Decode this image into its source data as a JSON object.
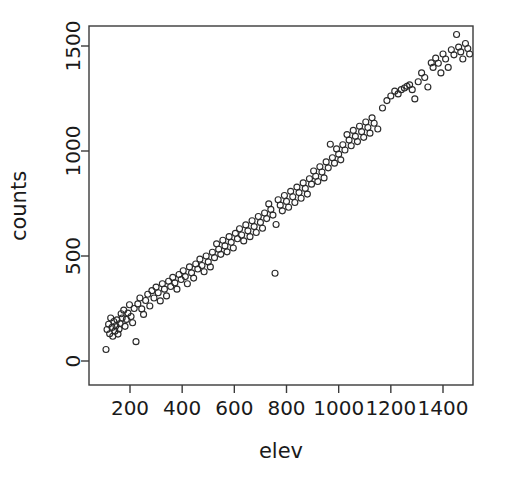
{
  "chart_data": {
    "type": "scatter",
    "title": "",
    "xlabel": "elev",
    "ylabel": "counts",
    "xlim": [
      62,
      1525
    ],
    "ylim": [
      -35,
      1610
    ],
    "xticks": [
      200,
      400,
      600,
      800,
      1000,
      1200,
      1400
    ],
    "yticks": [
      0,
      500,
      1000,
      1500
    ],
    "xtick_labels": [
      "200",
      "400",
      "600",
      "800",
      "1000",
      "1200",
      "1400"
    ],
    "ytick_labels": [
      "0",
      "500",
      "1000",
      "1500"
    ],
    "grid": false,
    "legend": "none",
    "marker": "open-circle",
    "marker_color": "#2b2b2b",
    "marker_size": 6,
    "n_points": 152,
    "points": [
      [
        108,
        55
      ],
      [
        112,
        150
      ],
      [
        118,
        175
      ],
      [
        122,
        130
      ],
      [
        126,
        205
      ],
      [
        131,
        160
      ],
      [
        134,
        118
      ],
      [
        138,
        188
      ],
      [
        142,
        142
      ],
      [
        146,
        168
      ],
      [
        150,
        196
      ],
      [
        154,
        128
      ],
      [
        158,
        152
      ],
      [
        162,
        178
      ],
      [
        166,
        225
      ],
      [
        170,
        205
      ],
      [
        176,
        242
      ],
      [
        181,
        165
      ],
      [
        186,
        198
      ],
      [
        192,
        228
      ],
      [
        198,
        268
      ],
      [
        204,
        212
      ],
      [
        210,
        182
      ],
      [
        216,
        250
      ],
      [
        223,
        92
      ],
      [
        230,
        272
      ],
      [
        238,
        300
      ],
      [
        245,
        248
      ],
      [
        252,
        222
      ],
      [
        260,
        288
      ],
      [
        268,
        318
      ],
      [
        276,
        262
      ],
      [
        284,
        335
      ],
      [
        292,
        300
      ],
      [
        300,
        352
      ],
      [
        308,
        325
      ],
      [
        316,
        286
      ],
      [
        324,
        368
      ],
      [
        332,
        342
      ],
      [
        340,
        310
      ],
      [
        348,
        380
      ],
      [
        356,
        355
      ],
      [
        364,
        398
      ],
      [
        372,
        372
      ],
      [
        380,
        342
      ],
      [
        388,
        412
      ],
      [
        396,
        388
      ],
      [
        404,
        430
      ],
      [
        412,
        402
      ],
      [
        420,
        368
      ],
      [
        428,
        448
      ],
      [
        436,
        420
      ],
      [
        444,
        395
      ],
      [
        452,
        462
      ],
      [
        460,
        438
      ],
      [
        468,
        485
      ],
      [
        476,
        455
      ],
      [
        484,
        425
      ],
      [
        492,
        500
      ],
      [
        500,
        472
      ],
      [
        508,
        448
      ],
      [
        516,
        518
      ],
      [
        524,
        492
      ],
      [
        532,
        558
      ],
      [
        540,
        532
      ],
      [
        548,
        508
      ],
      [
        556,
        575
      ],
      [
        564,
        548
      ],
      [
        572,
        520
      ],
      [
        580,
        592
      ],
      [
        588,
        565
      ],
      [
        596,
        538
      ],
      [
        604,
        608
      ],
      [
        612,
        582
      ],
      [
        620,
        630
      ],
      [
        628,
        600
      ],
      [
        636,
        572
      ],
      [
        644,
        648
      ],
      [
        652,
        620
      ],
      [
        660,
        592
      ],
      [
        668,
        668
      ],
      [
        676,
        640
      ],
      [
        684,
        612
      ],
      [
        692,
        688
      ],
      [
        700,
        660
      ],
      [
        708,
        632
      ],
      [
        716,
        705
      ],
      [
        724,
        678
      ],
      [
        732,
        748
      ],
      [
        740,
        722
      ],
      [
        748,
        695
      ],
      [
        756,
        418
      ],
      [
        760,
        650
      ],
      [
        768,
        768
      ],
      [
        776,
        742
      ],
      [
        784,
        715
      ],
      [
        792,
        788
      ],
      [
        800,
        760
      ],
      [
        808,
        732
      ],
      [
        816,
        808
      ],
      [
        824,
        782
      ],
      [
        832,
        755
      ],
      [
        840,
        828
      ],
      [
        848,
        802
      ],
      [
        856,
        775
      ],
      [
        864,
        848
      ],
      [
        872,
        822
      ],
      [
        880,
        795
      ],
      [
        888,
        868
      ],
      [
        896,
        842
      ],
      [
        904,
        905
      ],
      [
        912,
        880
      ],
      [
        920,
        855
      ],
      [
        928,
        925
      ],
      [
        936,
        900
      ],
      [
        944,
        872
      ],
      [
        952,
        948
      ],
      [
        960,
        920
      ],
      [
        968,
        1032
      ],
      [
        976,
        968
      ],
      [
        984,
        942
      ],
      [
        992,
        1010
      ],
      [
        1000,
        985
      ],
      [
        1008,
        958
      ],
      [
        1016,
        1030
      ],
      [
        1024,
        1005
      ],
      [
        1032,
        1078
      ],
      [
        1040,
        1052
      ],
      [
        1048,
        1025
      ],
      [
        1056,
        1098
      ],
      [
        1064,
        1070
      ],
      [
        1072,
        1045
      ],
      [
        1080,
        1118
      ],
      [
        1088,
        1092
      ],
      [
        1096,
        1065
      ],
      [
        1104,
        1138
      ],
      [
        1112,
        1112
      ],
      [
        1120,
        1085
      ],
      [
        1128,
        1158
      ],
      [
        1136,
        1132
      ],
      [
        1150,
        1105
      ],
      [
        1168,
        1205
      ],
      [
        1185,
        1240
      ],
      [
        1200,
        1262
      ],
      [
        1215,
        1285
      ],
      [
        1228,
        1272
      ],
      [
        1240,
        1292
      ],
      [
        1252,
        1300
      ],
      [
        1262,
        1308
      ],
      [
        1272,
        1315
      ],
      [
        1282,
        1292
      ],
      [
        1292,
        1248
      ],
      [
        1305,
        1330
      ],
      [
        1318,
        1372
      ],
      [
        1330,
        1350
      ],
      [
        1342,
        1305
      ],
      [
        1355,
        1420
      ],
      [
        1362,
        1398
      ],
      [
        1372,
        1442
      ],
      [
        1382,
        1418
      ],
      [
        1392,
        1372
      ],
      [
        1400,
        1462
      ],
      [
        1410,
        1438
      ],
      [
        1420,
        1398
      ],
      [
        1432,
        1482
      ],
      [
        1442,
        1458
      ],
      [
        1452,
        1555
      ],
      [
        1460,
        1495
      ],
      [
        1468,
        1472
      ],
      [
        1476,
        1438
      ],
      [
        1486,
        1512
      ],
      [
        1495,
        1488
      ],
      [
        1502,
        1462
      ]
    ]
  },
  "axes": {
    "x_title": "elev",
    "y_title": "counts"
  }
}
